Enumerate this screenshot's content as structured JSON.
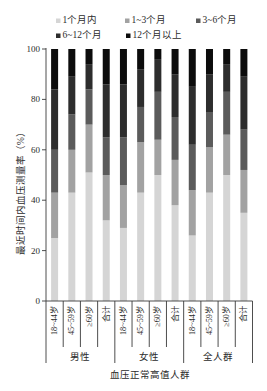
{
  "chart_data": {
    "type": "bar",
    "stacked": true,
    "title": "",
    "xlabel": "血压正常高值人群",
    "ylabel": "最近时间内血压测量率（%）",
    "ylim": [
      0,
      100
    ],
    "yticks": [
      0,
      20,
      40,
      60,
      80,
      100
    ],
    "grid": false,
    "legend_position": "top",
    "groups": [
      {
        "label": "男性",
        "size": 4
      },
      {
        "label": "女性",
        "size": 4
      },
      {
        "label": "全人群",
        "size": 4
      }
    ],
    "categories": [
      "18~44岁",
      "45~59岁",
      "≥60岁",
      "合计",
      "18~44岁",
      "45~59岁",
      "≥60岁",
      "合计",
      "18~44岁",
      "45~59岁",
      "≥60岁",
      "合计"
    ],
    "series": [
      {
        "name": "1个月内",
        "color": "#d5d5d5",
        "values": [
          25,
          43,
          51,
          32,
          29,
          43,
          50,
          38,
          26,
          43,
          50,
          35
        ]
      },
      {
        "name": "1~3个月",
        "color": "#a2a2a2",
        "values": [
          18,
          17,
          19,
          18,
          17,
          20,
          14,
          18,
          18,
          18,
          16,
          17
        ]
      },
      {
        "name": "3~6个月",
        "color": "#5b5b5b",
        "values": [
          17,
          14,
          14,
          15,
          19,
          14,
          19,
          17,
          18,
          14,
          17,
          16
        ]
      },
      {
        "name": "6~12个月",
        "color": "#2d2d2d",
        "values": [
          24,
          15,
          10,
          21,
          21,
          15,
          13,
          17,
          23,
          15,
          11,
          21
        ]
      },
      {
        "name": "12个月以上",
        "color": "#0c0c0c",
        "values": [
          16,
          11,
          6,
          14,
          14,
          8,
          4,
          10,
          15,
          10,
          6,
          11
        ]
      }
    ]
  }
}
